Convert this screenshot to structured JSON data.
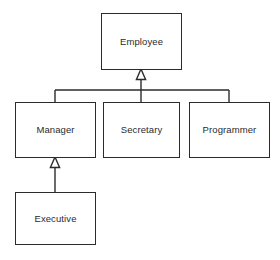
{
  "diagram": {
    "type": "uml-class-inheritance",
    "background_color": "#ffffff",
    "line_color": "#2b2b2b",
    "text_color": "#2b2b2b",
    "classes": [
      {
        "id": "employee",
        "label": "Employee",
        "x": 101,
        "y": 13,
        "width": 81,
        "height": 57
      },
      {
        "id": "manager",
        "label": "Manager",
        "x": 15,
        "y": 102,
        "width": 81,
        "height": 56
      },
      {
        "id": "secretary",
        "label": "Secretary",
        "x": 103,
        "y": 102,
        "width": 77,
        "height": 56
      },
      {
        "id": "programmer",
        "label": "Programmer",
        "x": 189,
        "y": 102,
        "width": 81,
        "height": 56
      },
      {
        "id": "executive",
        "label": "Executive",
        "x": 15,
        "y": 192,
        "width": 81,
        "height": 53
      }
    ],
    "generalizations": [
      {
        "from": "manager",
        "to": "employee"
      },
      {
        "from": "secretary",
        "to": "employee"
      },
      {
        "from": "programmer",
        "to": "employee"
      },
      {
        "from": "executive",
        "to": "manager"
      }
    ],
    "arrowhead": "hollow-triangle"
  }
}
